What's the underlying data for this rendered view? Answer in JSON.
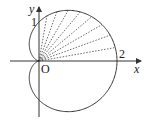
{
  "figure": {
    "curve": "cardioid",
    "equation": "r = 1 + cos θ",
    "labels": {
      "y_axis": "y",
      "x_axis": "x",
      "origin": "O",
      "tick_1": "1",
      "tick_2": "2"
    },
    "ray_angles_deg": [
      10,
      20,
      30,
      40,
      50,
      60,
      70,
      80
    ],
    "colors": {
      "stroke": "#333333"
    }
  }
}
